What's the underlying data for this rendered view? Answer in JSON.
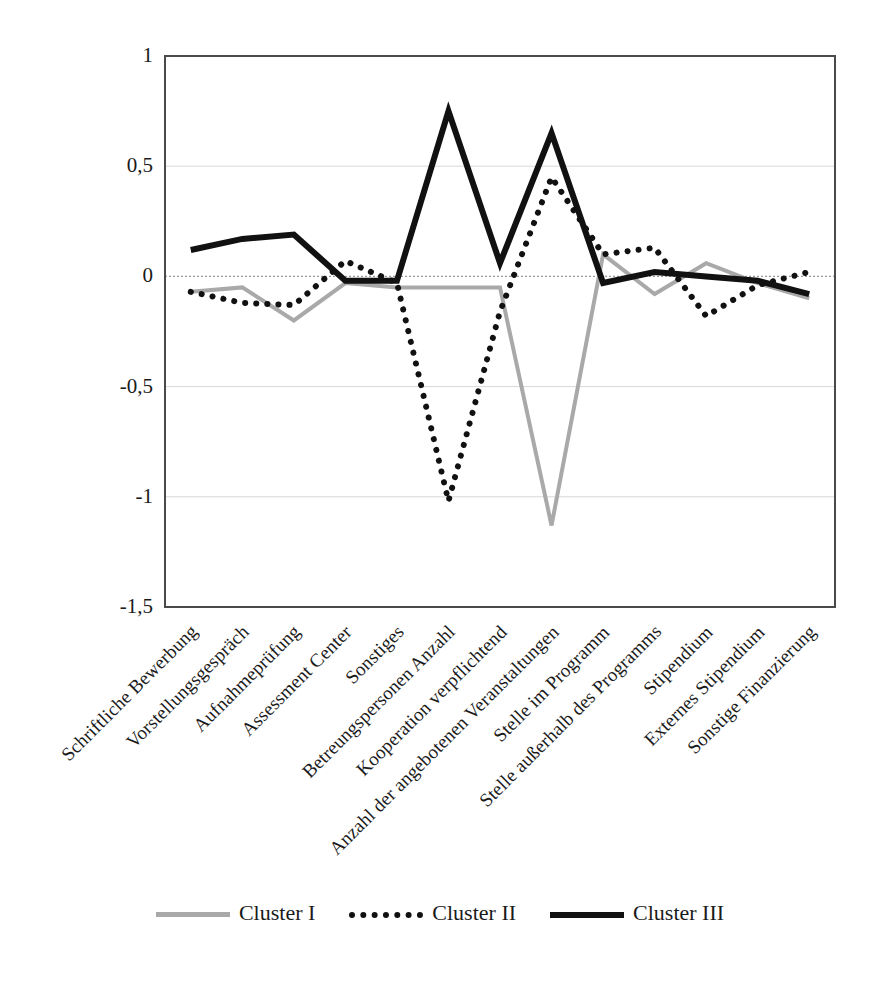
{
  "chart_data": {
    "type": "line",
    "title": "",
    "xlabel": "",
    "ylabel": "",
    "ylim": [
      -1.5,
      1.0
    ],
    "yticks": [
      "1",
      "0,5",
      "0",
      "-0,5",
      "-1",
      "-1,5"
    ],
    "ytick_values": [
      1,
      0.5,
      0,
      -0.5,
      -1,
      -1.5
    ],
    "grid": true,
    "grid_axis": "y",
    "legend_position": "bottom",
    "categories": [
      "Schriftliche Bewerbung",
      "Vorstellungsgespräch",
      "Aufnahmeprüfung",
      "Assessment Center",
      "Sonstiges",
      "Betreungspersonen Anzahl",
      "Kooperation verpflichtend",
      "Anzahl der angebotenen Veranstaltungen",
      "Stelle im Programm",
      "Stelle außerhalb des Programms",
      "Stipendium",
      "Externes Stipendium",
      "Sonstige Finanzierung"
    ],
    "series": [
      {
        "name": "Cluster I",
        "style": "solid",
        "color": "#a9a9a9",
        "width": 4,
        "values": [
          -0.07,
          -0.05,
          -0.2,
          -0.03,
          -0.05,
          -0.05,
          -0.05,
          -1.13,
          0.1,
          -0.08,
          0.06,
          -0.03,
          -0.1
        ]
      },
      {
        "name": "Cluster II",
        "style": "dotted",
        "color": "#111111",
        "width": 6,
        "values": [
          -0.07,
          -0.12,
          -0.13,
          0.07,
          -0.03,
          -1.02,
          -0.16,
          0.45,
          0.1,
          0.13,
          -0.18,
          -0.04,
          0.02
        ]
      },
      {
        "name": "Cluster III",
        "style": "solid",
        "color": "#111111",
        "width": 6,
        "values": [
          0.12,
          0.17,
          0.19,
          -0.02,
          -0.02,
          0.75,
          0.06,
          0.65,
          -0.03,
          0.02,
          0.0,
          -0.02,
          -0.08
        ]
      }
    ]
  },
  "legend": {
    "items": [
      {
        "label": "Cluster I"
      },
      {
        "label": "Cluster II"
      },
      {
        "label": "Cluster III"
      }
    ]
  }
}
